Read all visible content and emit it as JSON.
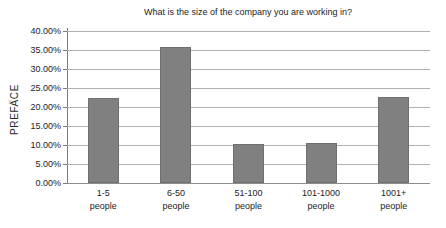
{
  "page": {
    "side_label": "PREFACE",
    "page_marker": "x"
  },
  "chart_data": {
    "type": "bar",
    "title": "What is the size of the company you are working in?",
    "xlabel": "",
    "ylabel": "",
    "categories": [
      "1-5 people",
      "6-50 people",
      "51-100 people",
      "101-1000 people",
      "1001+ people"
    ],
    "category_lines": [
      [
        "1-5",
        "people"
      ],
      [
        "6-50",
        "people"
      ],
      [
        "51-100",
        "people"
      ],
      [
        "101-1000",
        "people"
      ],
      [
        "1001+",
        "people"
      ]
    ],
    "values": [
      22.3,
      35.7,
      10.3,
      10.5,
      22.7
    ],
    "ylim": [
      0,
      40
    ],
    "ytick_values": [
      0,
      5,
      10,
      15,
      20,
      25,
      30,
      35,
      40
    ],
    "ytick_labels": [
      "0.00%",
      "5.00%",
      "10.00%",
      "15.00%",
      "20.00%",
      "25.00%",
      "30.00%",
      "35.00%",
      "40.00%"
    ],
    "grid": true,
    "legend": false,
    "bar_color": "#808080",
    "grid_color": "#b0b0b0",
    "axis_color": "#7a7a7a",
    "background": "#ffffff"
  }
}
